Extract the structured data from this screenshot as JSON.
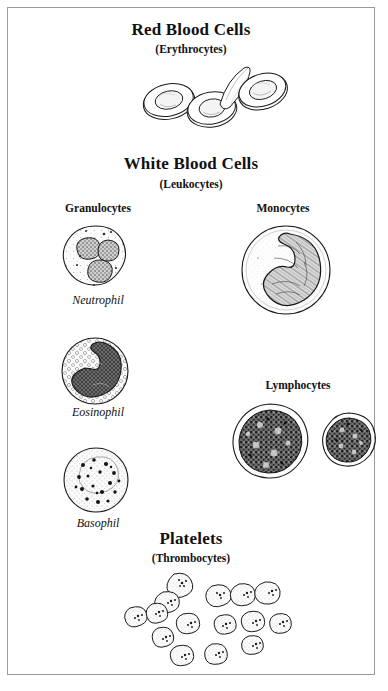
{
  "figure": {
    "background_color": "#ffffff",
    "ink_color": "#111111",
    "frame_color": "#9a9a9a"
  },
  "sections": {
    "red_blood_cells": {
      "title": "Red Blood Cells",
      "subtitle": "(Erythrocytes)"
    },
    "white_blood_cells": {
      "title": "White Blood Cells",
      "subtitle": "(Leukocytes)",
      "groups": {
        "granulocytes": {
          "label": "Granulocytes",
          "cells": [
            {
              "name": "Neutrophil"
            },
            {
              "name": "Eosinophil"
            },
            {
              "name": "Basophil"
            }
          ]
        },
        "monocytes": {
          "label": "Monocytes"
        },
        "lymphocytes": {
          "label": "Lymphocytes"
        }
      }
    },
    "platelets": {
      "title": "Platelets",
      "subtitle": "(Thrombocytes)"
    }
  }
}
